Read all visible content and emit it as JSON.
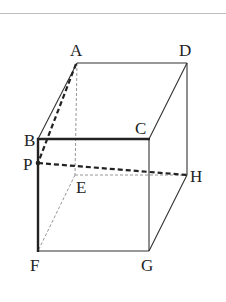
{
  "diagram": {
    "type": "cuboid",
    "labels": {
      "A": "A",
      "B": "B",
      "C": "C",
      "D": "D",
      "E": "E",
      "F": "F",
      "G": "G",
      "H": "H",
      "P": "P"
    },
    "vertices": {
      "A": [
        77,
        63
      ],
      "D": [
        187,
        63
      ],
      "B": [
        38,
        139
      ],
      "C": [
        149,
        139
      ],
      "E": [
        75,
        175
      ],
      "H": [
        187,
        175
      ],
      "F": [
        38,
        251
      ],
      "G": [
        149,
        251
      ],
      "P": [
        38,
        163
      ]
    },
    "edges": {
      "solid": [
        "AD",
        "AB",
        "DC",
        "DH",
        "CG",
        "FG",
        "GH"
      ],
      "bold": [
        "BC",
        "BF"
      ],
      "hidden_dashed": [
        "AE",
        "EF",
        "EH"
      ],
      "bold_dashed": [
        "AP",
        "PH"
      ]
    },
    "colors": {
      "line": "#222222",
      "hidden": "#888888",
      "rule": "#bdbdbd"
    }
  }
}
